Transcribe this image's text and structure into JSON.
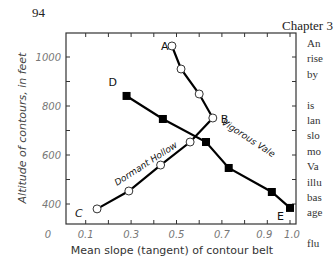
{
  "page": {
    "page_number": "94",
    "chapter": "Chapter 3",
    "side_text_lines": [
      "An",
      "rise",
      "by",
      "",
      "is",
      "lan",
      "slo",
      "mo",
      "Va",
      "illu",
      "bas",
      "age",
      "",
      "flu"
    ]
  },
  "chart_data": {
    "type": "line",
    "title": "",
    "xlabel": "Mean slope (tangent) of contour belt",
    "ylabel": "Altitude of contours, in feet",
    "x_ticks": [
      "0",
      "0.1",
      "0.3",
      "0.5",
      "0.7",
      "0.9",
      "1.0"
    ],
    "y_ticks": [
      "400",
      "600",
      "800",
      "1000"
    ],
    "xlim": [
      0,
      1.03
    ],
    "ylim": [
      330,
      1120
    ],
    "grid": false,
    "legend": "none",
    "series": [
      {
        "name": "Dormant Hollow",
        "marker": "open-circle",
        "start_label": "A",
        "turn_label": "B",
        "end_label": "C",
        "x": [
          0.48,
          0.52,
          0.6,
          0.66,
          0.56,
          0.43,
          0.29,
          0.15
        ],
        "y": [
          1045,
          951,
          849,
          751,
          653,
          559,
          453,
          380
        ]
      },
      {
        "name": "Vigorous Vale",
        "marker": "filled-square",
        "start_label": "D",
        "end_label": "E",
        "x": [
          0.28,
          0.44,
          0.63,
          0.73,
          0.92,
          1.0
        ],
        "y": [
          841,
          747,
          653,
          547,
          449,
          384
        ]
      }
    ],
    "annotations": [
      "A",
      "B",
      "C",
      "D",
      "E",
      "Dormant Hollow",
      "Vigorous Vale"
    ]
  }
}
